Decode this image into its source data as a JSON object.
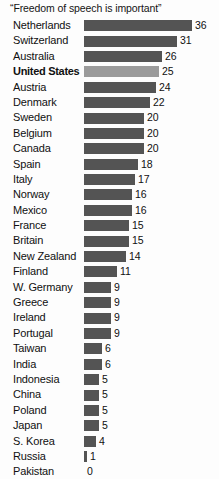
{
  "chart_data": {
    "type": "bar",
    "title": "“Freedom of speech is important”",
    "xlabel": "",
    "ylabel": "",
    "orientation": "horizontal",
    "grid": false,
    "legend": false,
    "xlim": [
      0,
      36
    ],
    "value_labels_shown": true,
    "highlight_category": "United States",
    "colors": {
      "bar": "#545454",
      "bar_highlight": "#9b9b9b",
      "background": "#fdfdfd",
      "text": "#101010"
    },
    "categories": [
      "Netherlands",
      "Switzerland",
      "Australia",
      "United States",
      "Austria",
      "Denmark",
      "Sweden",
      "Belgium",
      "Canada",
      "Spain",
      "Italy",
      "Norway",
      "Mexico",
      "France",
      "Britain",
      "New Zealand",
      "Finland",
      "W. Germany",
      "Greece",
      "Ireland",
      "Portugal",
      "Taiwan",
      "India",
      "Indonesia",
      "China",
      "Poland",
      "Japan",
      "S. Korea",
      "Russia",
      "Pakistan"
    ],
    "values": [
      36,
      31,
      26,
      25,
      24,
      22,
      20,
      20,
      20,
      18,
      17,
      16,
      16,
      15,
      15,
      14,
      11,
      9,
      9,
      9,
      9,
      6,
      6,
      5,
      5,
      5,
      5,
      4,
      1,
      0
    ]
  }
}
